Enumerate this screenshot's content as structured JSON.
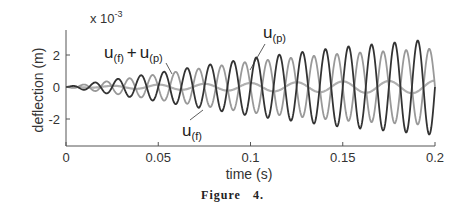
{
  "chart_data": {
    "type": "line",
    "title": "",
    "xlabel": "time (s)",
    "ylabel": "deflection (m)",
    "y_scale_label": "x 10",
    "y_scale_exponent": "-3",
    "xlim": [
      0,
      0.2
    ],
    "ylim": [
      -3.5,
      3.5
    ],
    "x_ticks": [
      "0",
      "0.05",
      "0.1",
      "0.15",
      "0.2"
    ],
    "y_ticks": [
      "2",
      "0",
      "-2"
    ],
    "grid": false,
    "legend": "none (inline annotations)",
    "annotations": [
      {
        "text": "u(f) + u(p)",
        "main": "u",
        "sub1": "(f)",
        "plus": "+",
        "main2": "u",
        "sub2": "(p)"
      },
      {
        "text": "u(p)",
        "main": "u",
        "sub": "(p)"
      },
      {
        "text": "u(f)",
        "main": "u",
        "sub": "(f)"
      }
    ],
    "series": [
      {
        "name": "u(f) + u(p)",
        "color": "#333333",
        "description": "growing oscillation, dark",
        "frequency_hz": 80,
        "amplitude_envelope": [
          [
            0,
            0.0
          ],
          [
            0.05,
            0.9
          ],
          [
            0.1,
            1.8
          ],
          [
            0.15,
            2.5
          ],
          [
            0.2,
            3.0
          ]
        ]
      },
      {
        "name": "u(p)",
        "color": "#999999",
        "description": "growing oscillation, light gray, anti-phase to u(f)+u(p)",
        "frequency_hz": 80,
        "amplitude_envelope": [
          [
            0,
            0.0
          ],
          [
            0.05,
            0.8
          ],
          [
            0.1,
            1.6
          ],
          [
            0.15,
            2.1
          ],
          [
            0.2,
            2.4
          ]
        ]
      },
      {
        "name": "u(f)",
        "color": "#b0b0b0",
        "description": "small oscillation near zero",
        "frequency_hz": 40,
        "amplitude_envelope": [
          [
            0,
            0.0
          ],
          [
            0.05,
            0.15
          ],
          [
            0.1,
            0.25
          ],
          [
            0.15,
            0.35
          ],
          [
            0.2,
            0.4
          ]
        ]
      }
    ]
  },
  "caption": {
    "label": "Figure",
    "number": "4."
  }
}
